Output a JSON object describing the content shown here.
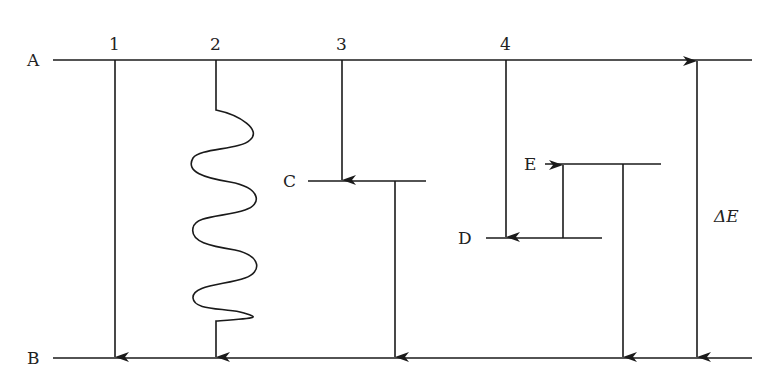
{
  "diagram": {
    "type": "energy-level-diagram",
    "levels": [
      {
        "id": "A",
        "label": "A",
        "y": 60,
        "x1": 53,
        "x2": 752
      },
      {
        "id": "B",
        "label": "B",
        "y": 358,
        "x1": 53,
        "x2": 752
      },
      {
        "id": "C",
        "label": "C",
        "y": 181,
        "x1": 308,
        "x2": 426
      },
      {
        "id": "D",
        "label": "D",
        "y": 238,
        "x1": 486,
        "x2": 602
      },
      {
        "id": "E",
        "label": "E",
        "y": 164,
        "x1": 545,
        "x2": 661
      }
    ],
    "transitions": [
      {
        "id": "1",
        "label": "1",
        "from": "A",
        "to": "B",
        "style": "straight"
      },
      {
        "id": "2",
        "label": "2",
        "from": "A",
        "to": "B",
        "style": "wavy"
      },
      {
        "id": "3",
        "label": "3",
        "from": "A",
        "to": "C",
        "style": "straight"
      },
      {
        "id": "3b",
        "label": "",
        "from": "C",
        "to": "B",
        "style": "straight"
      },
      {
        "id": "4",
        "label": "4",
        "from": "A",
        "to": "D",
        "style": "straight"
      },
      {
        "id": "4b",
        "label": "",
        "from": "D",
        "to": "E",
        "style": "straight"
      },
      {
        "id": "4c",
        "label": "",
        "from": "E",
        "to": "B",
        "style": "straight"
      }
    ],
    "energy_gap": {
      "label": "ΔE",
      "between": [
        "A",
        "B"
      ],
      "style": "double-arrow"
    },
    "colors": {
      "line": "#1a1a1a",
      "text": "#222222",
      "background": "#ffffff"
    }
  }
}
